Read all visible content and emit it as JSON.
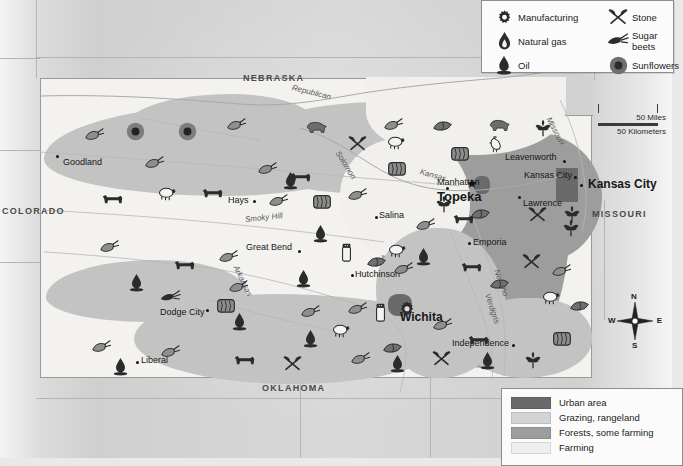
{
  "map": {
    "title": "Kansas economic activity and land use map",
    "state": "Kansas"
  },
  "neighbors": [
    {
      "name": "NEBRASKA",
      "x": 243,
      "y": 74
    },
    {
      "name": "COLORADO",
      "x": 2,
      "y": 207
    },
    {
      "name": "MISSOURI",
      "x": 592,
      "y": 210
    },
    {
      "name": "OKLAHOMA",
      "x": 262,
      "y": 384
    }
  ],
  "cities": [
    {
      "name": "Goodland",
      "x": 63,
      "y": 158,
      "dx": 56,
      "dy": 153,
      "style": "plain",
      "anchor": "left"
    },
    {
      "name": "Hays",
      "x": 228,
      "y": 196,
      "dx": 253,
      "dy": 200,
      "style": "plain",
      "anchor": "left"
    },
    {
      "name": "Great Bend",
      "x": 246,
      "y": 243,
      "dx": 298,
      "dy": 250,
      "style": "plain",
      "anchor": "left"
    },
    {
      "name": "Dodge City",
      "x": 160,
      "y": 308,
      "dx": 206,
      "dy": 309,
      "style": "plain",
      "anchor": "left"
    },
    {
      "name": "Liberal",
      "x": 141,
      "y": 356,
      "dx": 136,
      "dy": 361,
      "style": "plain",
      "anchor": "left"
    },
    {
      "name": "Hutchinson",
      "x": 355,
      "y": 270,
      "dx": 351,
      "dy": 274,
      "style": "plain",
      "anchor": "left"
    },
    {
      "name": "Salina",
      "x": 379,
      "y": 211,
      "dx": 375,
      "dy": 216,
      "style": "plain",
      "anchor": "left"
    },
    {
      "name": "Manhattan",
      "x": 437,
      "y": 182,
      "dx": 446,
      "dy": 187,
      "style": "plain",
      "anchor": "left"
    },
    {
      "name": "Topeka",
      "x": 462,
      "y": 190,
      "dx": 0,
      "dy": 0,
      "style": "capital",
      "anchor": "left"
    },
    {
      "name": "Leavenworth",
      "x": 511,
      "y": 154,
      "dx": 582,
      "dy": 160,
      "style": "plain",
      "anchor": "left"
    },
    {
      "name": "Kansas City",
      "x": 528,
      "y": 172,
      "dx": 561,
      "dy": 176,
      "style": "plain",
      "anchor": "left"
    },
    {
      "name": "Kansas City",
      "x": 592,
      "y": 182,
      "dx": 580,
      "dy": 183,
      "style": "bold",
      "anchor": "left"
    },
    {
      "name": "Lawrence",
      "x": 521,
      "y": 199,
      "dx": 518,
      "dy": 196,
      "style": "plain",
      "anchor": "left"
    },
    {
      "name": "Emporia",
      "x": 473,
      "y": 238,
      "dx": 468,
      "dy": 242,
      "style": "plain",
      "anchor": "left"
    },
    {
      "name": "Wichita",
      "x": 400,
      "y": 314,
      "dx": 0,
      "dy": 0,
      "style": "bold",
      "anchor": "left"
    },
    {
      "name": "Independence",
      "x": 458,
      "y": 340,
      "dx": 512,
      "dy": 344,
      "style": "plain",
      "anchor": "left"
    }
  ],
  "rivers": [
    {
      "name": "Republican",
      "x": 292,
      "y": 84,
      "rot": 14
    },
    {
      "name": "Solomon",
      "x": 337,
      "y": 148,
      "rot": 58
    },
    {
      "name": "Smoky Hill",
      "x": 245,
      "y": 216,
      "rot": -6
    },
    {
      "name": "Arkansas",
      "x": 235,
      "y": 262,
      "rot": 64
    },
    {
      "name": "Kansas",
      "x": 420,
      "y": 168,
      "rot": 16
    },
    {
      "name": "Missouri",
      "x": 548,
      "y": 114,
      "rot": 62
    },
    {
      "name": "Neosho",
      "x": 496,
      "y": 266,
      "rot": 70
    },
    {
      "name": "Verdigris",
      "x": 487,
      "y": 290,
      "rot": 72
    }
  ],
  "resource_legend": {
    "title": "Resources and products",
    "items": [
      {
        "label": "Manufacturing",
        "icon": "gear-icon"
      },
      {
        "label": "Stone",
        "icon": "pick-axe-icon"
      },
      {
        "label": "Natural gas",
        "icon": "gas-flame-icon"
      },
      {
        "label": "Sugar beets",
        "icon": "sugar-beet-icon"
      },
      {
        "label": "Oil",
        "icon": "oil-derrick-icon"
      },
      {
        "label": "Sunflowers",
        "icon": "sunflower-icon"
      }
    ]
  },
  "landuse_legend": {
    "items": [
      {
        "label": "Urban area",
        "color": "#6a6a6a"
      },
      {
        "label": "Grazing, rangeland",
        "color": "#d4d4d4"
      },
      {
        "label": "Forests, some farming",
        "color": "#9d9d9d"
      },
      {
        "label": "Farming",
        "color": "#efefef"
      }
    ]
  },
  "scale": {
    "miles_label": "50 Miles",
    "km_label": "50 Kilometers",
    "zero_top": "0",
    "zero_bottom": "0"
  },
  "compass": {
    "north": "N",
    "south": "S",
    "east": "E",
    "west": "W"
  },
  "map_icons": [
    {
      "icon": "wheat-icon",
      "x": 84,
      "y": 128
    },
    {
      "icon": "sunflower-icon",
      "x": 126,
      "y": 122
    },
    {
      "icon": "sunflower-icon",
      "x": 178,
      "y": 122
    },
    {
      "icon": "wheat-icon",
      "x": 226,
      "y": 118
    },
    {
      "icon": "hog-icon",
      "x": 305,
      "y": 120
    },
    {
      "icon": "wheat-icon",
      "x": 383,
      "y": 118
    },
    {
      "icon": "soybean-icon",
      "x": 432,
      "y": 118
    },
    {
      "icon": "hog-icon",
      "x": 488,
      "y": 118
    },
    {
      "icon": "corn-icon",
      "x": 534,
      "y": 120
    },
    {
      "icon": "wheat-icon",
      "x": 144,
      "y": 156
    },
    {
      "icon": "wheat-icon",
      "x": 257,
      "y": 162
    },
    {
      "icon": "pick-axe-icon",
      "x": 348,
      "y": 135
    },
    {
      "icon": "sheep-icon",
      "x": 385,
      "y": 135
    },
    {
      "icon": "hay-bale-icon",
      "x": 450,
      "y": 145
    },
    {
      "icon": "chicken-icon",
      "x": 487,
      "y": 136
    },
    {
      "icon": "cattle-icon",
      "x": 289,
      "y": 170
    },
    {
      "icon": "hay-bale-icon",
      "x": 387,
      "y": 160
    },
    {
      "icon": "oil-derrick-icon",
      "x": 283,
      "y": 172
    },
    {
      "icon": "sheep-icon",
      "x": 156,
      "y": 186
    },
    {
      "icon": "cattle-icon",
      "x": 201,
      "y": 186
    },
    {
      "icon": "cattle-icon",
      "x": 101,
      "y": 192
    },
    {
      "icon": "wheat-icon",
      "x": 268,
      "y": 194
    },
    {
      "icon": "hay-bale-icon",
      "x": 312,
      "y": 193
    },
    {
      "icon": "wheat-icon",
      "x": 347,
      "y": 188
    },
    {
      "icon": "wheat-icon",
      "x": 415,
      "y": 218
    },
    {
      "icon": "cattle-icon",
      "x": 452,
      "y": 212
    },
    {
      "icon": "pick-axe-icon",
      "x": 528,
      "y": 206
    },
    {
      "icon": "corn-icon",
      "x": 563,
      "y": 206
    },
    {
      "icon": "oil-derrick-icon",
      "x": 313,
      "y": 225
    },
    {
      "icon": "sheep-icon",
      "x": 386,
      "y": 243
    },
    {
      "icon": "wheat-icon",
      "x": 99,
      "y": 240
    },
    {
      "icon": "wheat-icon",
      "x": 218,
      "y": 250
    },
    {
      "icon": "cattle-icon",
      "x": 173,
      "y": 258
    },
    {
      "icon": "salt-shaker-icon",
      "x": 341,
      "y": 243
    },
    {
      "icon": "soybean-icon",
      "x": 366,
      "y": 254
    },
    {
      "icon": "wheat-icon",
      "x": 393,
      "y": 262
    },
    {
      "icon": "oil-derrick-icon",
      "x": 296,
      "y": 270
    },
    {
      "icon": "oil-derrick-icon",
      "x": 416,
      "y": 248
    },
    {
      "icon": "cattle-icon",
      "x": 460,
      "y": 260
    },
    {
      "icon": "pick-axe-icon",
      "x": 522,
      "y": 253
    },
    {
      "icon": "wheat-icon",
      "x": 551,
      "y": 264
    },
    {
      "icon": "soybean-icon",
      "x": 489,
      "y": 276
    },
    {
      "icon": "oil-derrick-icon",
      "x": 129,
      "y": 274
    },
    {
      "icon": "sugar-beet-icon",
      "x": 160,
      "y": 290
    },
    {
      "icon": "hay-bale-icon",
      "x": 216,
      "y": 297
    },
    {
      "icon": "wheat-icon",
      "x": 228,
      "y": 280
    },
    {
      "icon": "wheat-icon",
      "x": 300,
      "y": 305
    },
    {
      "icon": "wheat-icon",
      "x": 347,
      "y": 302
    },
    {
      "icon": "salt-shaker-icon",
      "x": 375,
      "y": 303
    },
    {
      "icon": "gear-icon",
      "x": 398,
      "y": 300
    },
    {
      "icon": "oil-derrick-icon",
      "x": 232,
      "y": 313
    },
    {
      "icon": "sheep-icon",
      "x": 330,
      "y": 323
    },
    {
      "icon": "oil-derrick-icon",
      "x": 303,
      "y": 330
    },
    {
      "icon": "soybean-icon",
      "x": 382,
      "y": 340
    },
    {
      "icon": "wheat-icon",
      "x": 432,
      "y": 318
    },
    {
      "icon": "cattle-icon",
      "x": 467,
      "y": 333
    },
    {
      "icon": "sheep-icon",
      "x": 540,
      "y": 290
    },
    {
      "icon": "soybean-icon",
      "x": 569,
      "y": 298
    },
    {
      "icon": "corn-icon",
      "x": 562,
      "y": 220
    },
    {
      "icon": "hay-bale-icon",
      "x": 552,
      "y": 330
    },
    {
      "icon": "wheat-icon",
      "x": 91,
      "y": 340
    },
    {
      "icon": "oil-derrick-icon",
      "x": 113,
      "y": 358
    },
    {
      "icon": "wheat-icon",
      "x": 160,
      "y": 345
    },
    {
      "icon": "cattle-icon",
      "x": 233,
      "y": 353
    },
    {
      "icon": "pick-axe-icon",
      "x": 283,
      "y": 355
    },
    {
      "icon": "wheat-icon",
      "x": 350,
      "y": 352
    },
    {
      "icon": "oil-derrick-icon",
      "x": 390,
      "y": 355
    },
    {
      "icon": "pick-axe-icon",
      "x": 432,
      "y": 350
    },
    {
      "icon": "oil-derrick-icon",
      "x": 480,
      "y": 352
    },
    {
      "icon": "corn-icon",
      "x": 524,
      "y": 352
    },
    {
      "icon": "corn-icon",
      "x": 435,
      "y": 196
    },
    {
      "icon": "soybean-icon",
      "x": 470,
      "y": 206
    }
  ]
}
